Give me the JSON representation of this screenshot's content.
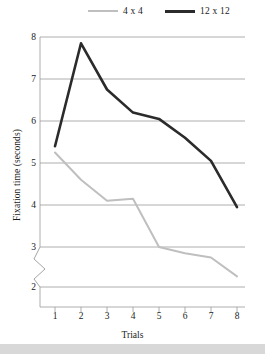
{
  "chart_data": {
    "type": "line",
    "title": "",
    "xlabel": "Trials",
    "ylabel": "Fixation time (seconds)",
    "x": [
      1,
      2,
      3,
      4,
      5,
      6,
      7,
      8
    ],
    "xtick_labels": [
      "1",
      "2",
      "3",
      "4",
      "5",
      "6",
      "7",
      "8"
    ],
    "ytick_labels": [
      "8",
      "7",
      "6",
      "5",
      "4",
      "3",
      "2"
    ],
    "ylim": [
      2,
      8
    ],
    "yticks": [
      2,
      3,
      4,
      5,
      6,
      7,
      8
    ],
    "y_axis_break": true,
    "y_axis_break_between": [
      2,
      3
    ],
    "grid": true,
    "grid_axis": "y",
    "legend_position": "top",
    "series": [
      {
        "name": "4 x 4",
        "color": "#bfbfbf",
        "values": [
          5.25,
          4.6,
          4.1,
          4.15,
          3.0,
          2.85,
          2.75,
          2.3
        ]
      },
      {
        "name": "12 x 12",
        "color": "#2b2b2b",
        "values": [
          5.4,
          7.85,
          6.75,
          6.2,
          6.05,
          5.6,
          5.05,
          3.95
        ]
      }
    ]
  },
  "legend": {
    "entries": [
      {
        "label": "4 x 4"
      },
      {
        "label": "12 x 12"
      }
    ]
  },
  "axes": {
    "y_title": "Fixation time (seconds)",
    "x_title": "Trials"
  }
}
